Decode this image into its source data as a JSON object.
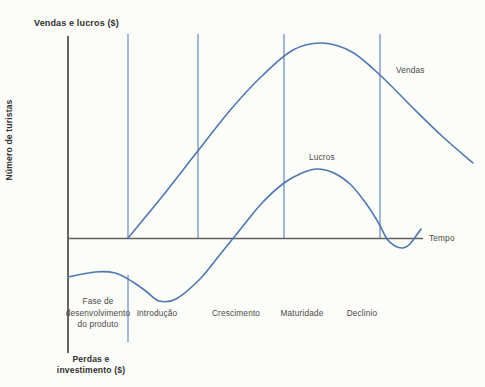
{
  "figure": {
    "title": "Vendas e lucros ($)",
    "y_axis_label": "Número de turistas",
    "x_axis_label": "Tempo",
    "below_axis_label": "Perdas e\ninvestimento ($)",
    "curve_labels": {
      "vendas": "Vendas",
      "lucros": "Lucros"
    },
    "phases": [
      "Fase de\ndesenvolvimento\ndo produto",
      "Introdução",
      "Crescimento",
      "Maturidade",
      "Declinio"
    ]
  },
  "chart_data": {
    "type": "line",
    "title": "Vendas e lucros ($)",
    "xlabel": "Tempo",
    "ylabel": "Vendas e lucros ($) / Número de turistas; abaixo do eixo: Perdas e investimento ($)",
    "axis_numeric_ticks": false,
    "grid": false,
    "legend_position": "labels-near-curves",
    "units_note": "No numeric scale shown; y in relative units (horizontal time axis = 0, sales peak = 100); x = % of time axis length from origin",
    "phase_boundaries_x_pct": [
      16.9,
      36.6,
      60.8,
      87.9
    ],
    "series": [
      {
        "name": "Vendas",
        "points": [
          [
            16.9,
            0
          ],
          [
            26.2,
            20.5
          ],
          [
            36.3,
            44.1
          ],
          [
            46.2,
            66.7
          ],
          [
            54.9,
            83.6
          ],
          [
            63.4,
            96.4
          ],
          [
            71.5,
            100
          ],
          [
            80.0,
            95.4
          ],
          [
            88.2,
            83.3
          ],
          [
            96.9,
            67.2
          ],
          [
            105.6,
            51.8
          ],
          [
            114.1,
            38.5
          ]
        ]
      },
      {
        "name": "Lucros",
        "points": [
          [
            0,
            -20.0
          ],
          [
            7.6,
            -17.4
          ],
          [
            13.2,
            -17.9
          ],
          [
            18.3,
            -22.6
          ],
          [
            22.3,
            -27.7
          ],
          [
            25.6,
            -32.3
          ],
          [
            30.4,
            -31.3
          ],
          [
            37.2,
            -21.0
          ],
          [
            43.4,
            -7.2
          ],
          [
            49.3,
            6.2
          ],
          [
            54.6,
            17.9
          ],
          [
            60.8,
            28.2
          ],
          [
            65.9,
            33.3
          ],
          [
            70.1,
            35.4
          ],
          [
            74.9,
            33.3
          ],
          [
            79.4,
            27.7
          ],
          [
            83.7,
            18.5
          ],
          [
            87.3,
            8.2
          ],
          [
            89.9,
            -0.3
          ],
          [
            92.1,
            -4.1
          ],
          [
            94.4,
            -5.1
          ],
          [
            96.3,
            -3.1
          ],
          [
            98.0,
            1.0
          ],
          [
            99.4,
            4.6
          ]
        ]
      }
    ],
    "render": {
      "width": 485,
      "height": 387,
      "background": "#fcfcf9",
      "curve_color": "#4e79b0",
      "curve_width": 1.6,
      "divider_color": "#7293c2",
      "divider_width": 1.3,
      "axes": [
        {
          "name": "y-axis",
          "x1": 68,
          "y1": 36,
          "x2": 68,
          "y2": 353,
          "color": "#4a4a4a",
          "width": 1.7
        },
        {
          "name": "x-axis",
          "x1": 68,
          "y1": 238.5,
          "x2": 423,
          "y2": 238.5,
          "color": "#606060",
          "width": 1.7
        }
      ],
      "dividers": [
        {
          "x": 128,
          "y1": 34,
          "y2": 238
        },
        {
          "x": 128,
          "y1": 275,
          "y2": 342
        },
        {
          "x": 198,
          "y1": 34,
          "y2": 238
        },
        {
          "x": 284,
          "y1": 34,
          "y2": 238
        },
        {
          "x": 380,
          "y1": 34,
          "y2": 238
        }
      ],
      "series_px": {
        "vendas": [
          [
            128,
            238
          ],
          [
            161,
            198
          ],
          [
            197,
            152
          ],
          [
            232,
            108
          ],
          [
            263,
            75
          ],
          [
            293,
            50
          ],
          [
            322,
            43
          ],
          [
            352,
            52
          ],
          [
            381,
            76
          ],
          [
            412,
            107
          ],
          [
            443,
            137
          ],
          [
            473,
            163
          ]
        ],
        "lucros": [
          [
            68,
            277
          ],
          [
            95,
            272
          ],
          [
            115,
            273
          ],
          [
            133,
            282
          ],
          [
            147,
            292
          ],
          [
            159,
            301
          ],
          [
            176,
            299
          ],
          [
            200,
            279
          ],
          [
            222,
            252
          ],
          [
            243,
            226
          ],
          [
            262,
            203
          ],
          [
            284,
            183
          ],
          [
            302,
            173
          ],
          [
            317,
            169
          ],
          [
            334,
            173
          ],
          [
            350,
            184
          ],
          [
            365,
            202
          ],
          [
            378,
            222
          ],
          [
            387,
            239
          ],
          [
            395,
            246
          ],
          [
            403,
            248
          ],
          [
            410,
            244
          ],
          [
            416,
            236
          ],
          [
            421,
            229
          ]
        ]
      }
    }
  },
  "colors": {
    "curve": "#4e79b0",
    "divider": "#7293c2",
    "axis": "#4a4a4a",
    "text": "#3f3f3f",
    "background": "#fcfcf9"
  }
}
